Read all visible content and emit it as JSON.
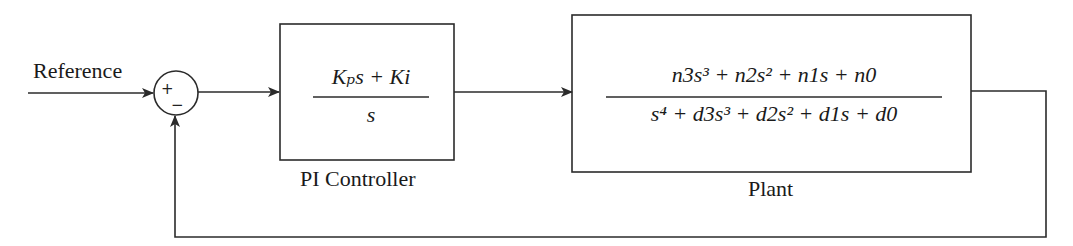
{
  "diagram": {
    "type": "closed-loop control block diagram",
    "input": {
      "label": "Reference"
    },
    "summing_junction": {
      "signs": {
        "top_left": "+",
        "bottom": "−"
      }
    },
    "blocks": [
      {
        "id": "controller",
        "caption": "PI Controller",
        "transfer_function": {
          "numerator": "Kₚs + Ki",
          "denominator": "s"
        }
      },
      {
        "id": "plant",
        "caption": "Plant",
        "transfer_function": {
          "numerator": "n3s³ + n2s² + n1s + n0",
          "denominator": "s⁴ + d3s³ + d2s² + d1s + d0"
        }
      }
    ],
    "connections": [
      {
        "from": "Reference",
        "to": "summing_junction",
        "sign": "+"
      },
      {
        "from": "summing_junction",
        "to": "controller"
      },
      {
        "from": "controller",
        "to": "plant"
      },
      {
        "from": "plant",
        "to": "summing_junction",
        "sign": "−",
        "path": "feedback"
      }
    ],
    "colors": {
      "stroke": "#2b2b2b",
      "text": "#1a1a1a",
      "background": "#ffffff"
    }
  }
}
